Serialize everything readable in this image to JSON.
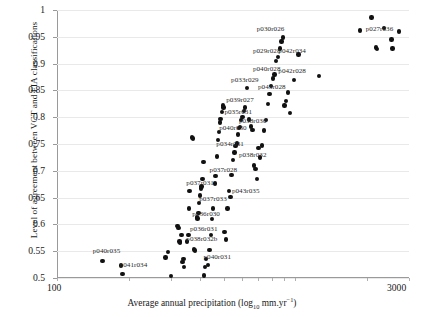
{
  "figure": {
    "top_cut_text": "",
    "background": "#ffffff",
    "point_color": "#111111",
    "grid_color": "#e9e9e9",
    "axis_color": "#9a9a9a"
  },
  "axes": {
    "y_title": "Level of agreement between VCT and FIA classifications",
    "x_title_pre": "Average annual precipitation (log",
    "x_title_sub": "10",
    "x_title_mid": " mm.yr",
    "x_title_sup": "−1",
    "x_title_post": ")",
    "y_ticks": [
      "1",
      "0.95",
      "0.9",
      "0.85",
      "0.8",
      "0.75",
      "0.7",
      "0.65",
      "0.6",
      "0.55",
      "0.5"
    ],
    "x_ticks": [
      "100",
      "3000"
    ]
  },
  "chart_data": {
    "type": "scatter",
    "title": "",
    "xlabel": "Average annual precipitation (log10 mm.yr-1)",
    "ylabel": "Level of agreement between VCT and FIA classifications",
    "xscale": "log",
    "xlim": [
      100,
      3000
    ],
    "ylim": [
      0.5,
      1.0
    ],
    "grid": true,
    "legend": "none",
    "series": [
      {
        "name": "scenes",
        "points": [
          [
            155,
            0.532
          ],
          [
            186,
            0.523
          ],
          [
            188,
            0.507
          ],
          [
            285,
            0.538
          ],
          [
            293,
            0.548
          ],
          [
            300,
            0.504
          ],
          [
            320,
            0.597
          ],
          [
            324,
            0.593
          ],
          [
            327,
            0.568
          ],
          [
            329,
            0.566
          ],
          [
            333,
            0.58
          ],
          [
            336,
            0.53
          ],
          [
            339,
            0.535
          ],
          [
            341,
            0.521
          ],
          [
            352,
            0.568
          ],
          [
            356,
            0.58
          ],
          [
            358,
            0.63
          ],
          [
            360,
            0.662
          ],
          [
            368,
            0.762
          ],
          [
            372,
            0.76
          ],
          [
            376,
            0.553
          ],
          [
            380,
            0.551
          ],
          [
            386,
            0.613
          ],
          [
            389,
            0.611
          ],
          [
            392,
            0.621
          ],
          [
            395,
            0.64
          ],
          [
            398,
            0.654
          ],
          [
            401,
            0.667
          ],
          [
            404,
            0.671
          ],
          [
            408,
            0.685
          ],
          [
            412,
            0.717
          ],
          [
            414,
            0.505
          ],
          [
            418,
            0.52
          ],
          [
            422,
            0.535
          ],
          [
            430,
            0.524
          ],
          [
            436,
            0.552
          ],
          [
            442,
            0.58
          ],
          [
            447,
            0.61
          ],
          [
            452,
            0.63
          ],
          [
            459,
            0.676
          ],
          [
            463,
            0.69
          ],
          [
            468,
            0.727
          ],
          [
            474,
            0.758
          ],
          [
            478,
            0.772
          ],
          [
            482,
            0.79
          ],
          [
            486,
            0.797
          ],
          [
            492,
            0.81
          ],
          [
            496,
            0.822
          ],
          [
            500,
            0.818
          ],
          [
            505,
            0.586
          ],
          [
            512,
            0.572
          ],
          [
            520,
            0.63
          ],
          [
            527,
            0.662
          ],
          [
            534,
            0.651
          ],
          [
            540,
            0.692
          ],
          [
            548,
            0.72
          ],
          [
            556,
            0.734
          ],
          [
            562,
            0.746
          ],
          [
            568,
            0.751
          ],
          [
            574,
            0.768
          ],
          [
            580,
            0.78
          ],
          [
            586,
            0.782
          ],
          [
            592,
            0.795
          ],
          [
            600,
            0.8
          ],
          [
            608,
            0.812
          ],
          [
            616,
            0.818
          ],
          [
            628,
            0.855
          ],
          [
            640,
            0.796
          ],
          [
            652,
            0.783
          ],
          [
            662,
            0.776
          ],
          [
            672,
            0.71
          ],
          [
            680,
            0.703
          ],
          [
            690,
            0.685
          ],
          [
            700,
            0.742
          ],
          [
            712,
            0.725
          ],
          [
            724,
            0.747
          ],
          [
            738,
            0.775
          ],
          [
            752,
            0.795
          ],
          [
            768,
            0.825
          ],
          [
            780,
            0.843
          ],
          [
            792,
            0.858
          ],
          [
            805,
            0.872
          ],
          [
            818,
            0.88
          ],
          [
            832,
            0.905
          ],
          [
            846,
            0.912
          ],
          [
            860,
            0.928
          ],
          [
            874,
            0.941
          ],
          [
            886,
            0.949
          ],
          [
            900,
            0.822
          ],
          [
            915,
            0.83
          ],
          [
            930,
            0.846
          ],
          [
            948,
            0.808
          ],
          [
            985,
            0.869
          ],
          [
            1030,
            0.917
          ],
          [
            1260,
            0.877
          ],
          [
            1870,
            0.962
          ],
          [
            2090,
            0.986
          ],
          [
            2180,
            0.93
          ],
          [
            2200,
            0.927
          ],
          [
            2350,
            0.967
          ],
          [
            2530,
            0.945
          ],
          [
            2560,
            0.928
          ],
          [
            2720,
            0.96
          ]
        ]
      }
    ],
    "annotations": [
      {
        "text": "p030r026",
        "x": 820,
        "y": 0.963
      },
      {
        "text": "p029r028",
        "x": 790,
        "y": 0.921
      },
      {
        "text": "p042r034",
        "x": 1010,
        "y": 0.922
      },
      {
        "text": "p040r028",
        "x": 790,
        "y": 0.888
      },
      {
        "text": "p042r028",
        "x": 1010,
        "y": 0.884
      },
      {
        "text": "p033r029",
        "x": 640,
        "y": 0.867
      },
      {
        "text": "p043r028",
        "x": 830,
        "y": 0.855
      },
      {
        "text": "p039r027",
        "x": 610,
        "y": 0.83
      },
      {
        "text": "p035r031",
        "x": 600,
        "y": 0.808
      },
      {
        "text": "p038r030",
        "x": 690,
        "y": 0.791
      },
      {
        "text": "p040r030",
        "x": 570,
        "y": 0.778
      },
      {
        "text": "p034r031",
        "x": 555,
        "y": 0.748
      },
      {
        "text": "p038r032",
        "x": 690,
        "y": 0.728
      },
      {
        "text": "p037r028",
        "x": 520,
        "y": 0.7
      },
      {
        "text": "p037r031",
        "x": 415,
        "y": 0.675
      },
      {
        "text": "p043r035",
        "x": 645,
        "y": 0.66
      },
      {
        "text": "p037r033",
        "x": 470,
        "y": 0.645
      },
      {
        "text": "p036r030",
        "x": 440,
        "y": 0.617
      },
      {
        "text": "p036r031",
        "x": 430,
        "y": 0.59
      },
      {
        "text": "p038r032b",
        "x": 415,
        "y": 0.57
      },
      {
        "text": "p040r035",
        "x": 168,
        "y": 0.548
      },
      {
        "text": "p041r034",
        "x": 218,
        "y": 0.522
      },
      {
        "text": "p040r031",
        "x": 490,
        "y": 0.538
      },
      {
        "text": "p027r036",
        "x": 2350,
        "y": 0.963
      }
    ]
  }
}
